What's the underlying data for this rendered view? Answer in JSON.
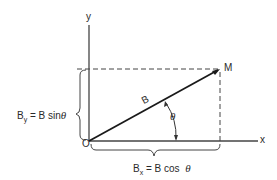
{
  "diagram": {
    "title": "",
    "axes": {
      "x_label": "x",
      "y_label": "y",
      "origin_label": "O"
    },
    "point_label": "M",
    "vector_label": "B",
    "angle_label": "θ",
    "y_component": {
      "symbol": "B",
      "subscript": "y",
      "rhs": "= B sin",
      "angle": "θ"
    },
    "x_component": {
      "symbol": "B",
      "subscript": "x",
      "rhs": "= B cos",
      "angle": "θ"
    },
    "colors": {
      "stroke": "#2a2a2a",
      "background": "#ffffff"
    }
  }
}
